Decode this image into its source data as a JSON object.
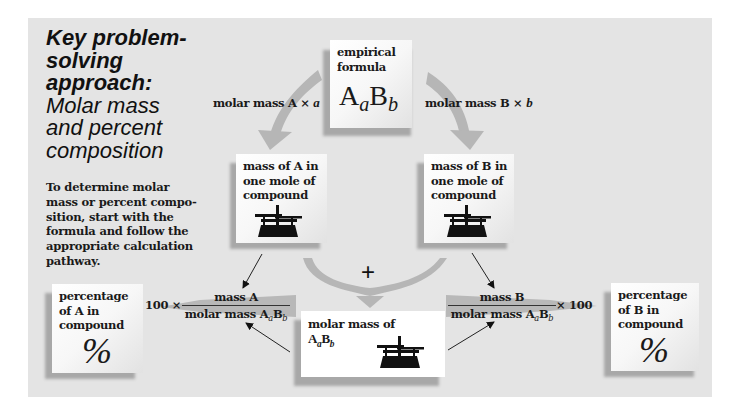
{
  "title": {
    "bold": "Key problem-\nsolving\napproach:",
    "subtitle": "Molar mass\nand percent\ncomposition"
  },
  "description": "To determine molar\nmass or percent compo-\nsition, start with the\nformula and follow the\nappropriate calculation\npathway.",
  "nodes": {
    "empirical_formula": {
      "label": "empirical\nformula",
      "formula_a": "A",
      "sub_a": "a",
      "formula_b": "B",
      "sub_b": "b"
    },
    "mass_a": {
      "label": "mass of A in\none mole of\ncompound",
      "icon": "balance-scale-icon"
    },
    "mass_b": {
      "label": "mass of B in\none mole of\ncompound",
      "icon": "balance-scale-icon"
    },
    "molar_mass": {
      "label": "molar mass of",
      "formula_a": "A",
      "sub_a": "a",
      "formula_b": "B",
      "sub_b": "b",
      "icon": "balance-scale-icon"
    },
    "percent_a": {
      "label": "percentage\nof A in\ncompound",
      "symbol": "%"
    },
    "percent_b": {
      "label": "percentage\nof B in\ncompound",
      "symbol": "%"
    }
  },
  "edges": {
    "to_mass_a": {
      "text": "molar mass A × ",
      "var": "a"
    },
    "to_mass_b": {
      "text": "molar mass B × ",
      "var": "b"
    },
    "combine": "+",
    "to_percent_a": {
      "prefix": "100 ×",
      "numerator": "mass A",
      "denominator": "molar mass A",
      "sub_a": "a",
      "den_b": "B",
      "sub_b": "b"
    },
    "to_percent_b": {
      "suffix": "× 100",
      "numerator": "mass B",
      "denominator": "molar mass A",
      "sub_a": "a",
      "den_b": "B",
      "sub_b": "b"
    }
  },
  "colors": {
    "panel": "#e4e4e4",
    "arrow": "#b4b4b4",
    "shadow": "#a8a8a8",
    "text": "#1a1a1a"
  }
}
